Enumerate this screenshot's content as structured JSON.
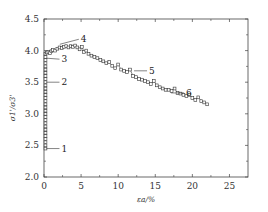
{
  "chart_data": {
    "type": "line",
    "title": "",
    "xlabel": "εa/%",
    "ylabel": "σ1'/σ3'",
    "xlim": [
      0,
      27.5
    ],
    "ylim": [
      2.0,
      4.5
    ],
    "xticks": [
      0,
      5,
      10,
      15,
      20,
      25
    ],
    "yticks": [
      2.0,
      2.5,
      3.0,
      3.5,
      4.0,
      4.5
    ],
    "ytick_labels": [
      "2.0",
      "2.5",
      "3.0",
      "3.5",
      "4.0",
      "4.5"
    ],
    "grid": false,
    "legend": null,
    "marker": "open-square",
    "series": [
      {
        "name": "stress ratio",
        "x": [
          0.2,
          0.2,
          0.2,
          0.2,
          0.2,
          0.2,
          0.2,
          0.2,
          0.2,
          0.2,
          0.2,
          0.2,
          0.2,
          0.2,
          0.2,
          0.2,
          0.2,
          0.2,
          0.2,
          0.2,
          0.2,
          0.2,
          0.2,
          0.2,
          0.2,
          0.2,
          0.2,
          0.2,
          0.2,
          0.2,
          0.2,
          0.4,
          0.6,
          0.8,
          1.0,
          1.2,
          1.5,
          1.8,
          2.1,
          2.4,
          2.7,
          3.0,
          3.3,
          3.6,
          3.9,
          4.2,
          4.5,
          4.8,
          5.1,
          5.4,
          5.7,
          6.0,
          6.4,
          6.8,
          7.2,
          7.6,
          8.0,
          8.4,
          8.8,
          9.2,
          9.6,
          10.0,
          10.4,
          10.8,
          11.2,
          11.6,
          12.0,
          12.4,
          12.8,
          13.2,
          13.6,
          14.0,
          14.4,
          14.8,
          15.2,
          15.6,
          16.0,
          16.4,
          16.8,
          17.2,
          17.6,
          18.0,
          18.4,
          18.8,
          19.2,
          19.6,
          20.0,
          20.4,
          20.8,
          21.2,
          21.6,
          22.0
        ],
        "y": [
          2.45,
          2.5,
          2.55,
          2.6,
          2.65,
          2.7,
          2.75,
          2.8,
          2.85,
          2.9,
          2.95,
          3.0,
          3.05,
          3.1,
          3.15,
          3.2,
          3.25,
          3.3,
          3.35,
          3.4,
          3.45,
          3.5,
          3.55,
          3.6,
          3.65,
          3.7,
          3.75,
          3.8,
          3.85,
          3.9,
          3.95,
          3.97,
          3.98,
          3.96,
          3.99,
          4.01,
          4.0,
          4.03,
          4.05,
          4.04,
          4.06,
          4.07,
          4.05,
          4.07,
          4.06,
          4.08,
          4.05,
          4.02,
          4.06,
          3.98,
          4.0,
          3.95,
          3.92,
          3.9,
          3.88,
          3.85,
          3.83,
          3.8,
          3.82,
          3.76,
          3.72,
          3.78,
          3.7,
          3.68,
          3.66,
          3.7,
          3.6,
          3.58,
          3.55,
          3.54,
          3.52,
          3.5,
          3.47,
          3.52,
          3.45,
          3.42,
          3.4,
          3.38,
          3.38,
          3.36,
          3.4,
          3.33,
          3.32,
          3.3,
          3.28,
          3.3,
          3.25,
          3.22,
          3.26,
          3.2,
          3.18,
          3.15
        ]
      }
    ],
    "annotations": [
      {
        "label": "1",
        "x": 0.2,
        "y": 2.45
      },
      {
        "label": "2",
        "x": 0.2,
        "y": 3.5
      },
      {
        "label": "3",
        "x": 0.2,
        "y": 3.88
      },
      {
        "label": "4",
        "x": 2.0,
        "y": 4.1
      },
      {
        "label": "5",
        "x": 12.0,
        "y": 3.68
      },
      {
        "label": "6",
        "x": 17.0,
        "y": 3.33
      }
    ]
  }
}
